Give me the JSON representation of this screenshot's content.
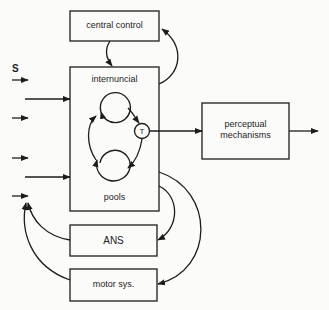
{
  "diagram": {
    "stimulus_label": "S",
    "nodes": {
      "central_control": "central control",
      "internuncial": "internuncial",
      "pools": "pools",
      "t_node": "T",
      "perceptual_line1": "perceptual",
      "perceptual_line2": "mechanisms",
      "ans": "ANS",
      "motor": "motor sys."
    },
    "edges": [
      {
        "from": "S",
        "to": "internuncial pools"
      },
      {
        "from": "central control",
        "to": "internuncial pools"
      },
      {
        "from": "internuncial pools",
        "to": "central control"
      },
      {
        "from": "T",
        "to": "perceptual mechanisms"
      },
      {
        "from": "perceptual mechanisms",
        "to": "output"
      },
      {
        "from": "internuncial pools",
        "to": "ANS"
      },
      {
        "from": "internuncial pools",
        "to": "motor sys."
      },
      {
        "from": "ANS",
        "to": "input"
      },
      {
        "from": "motor sys.",
        "to": "input"
      }
    ]
  }
}
